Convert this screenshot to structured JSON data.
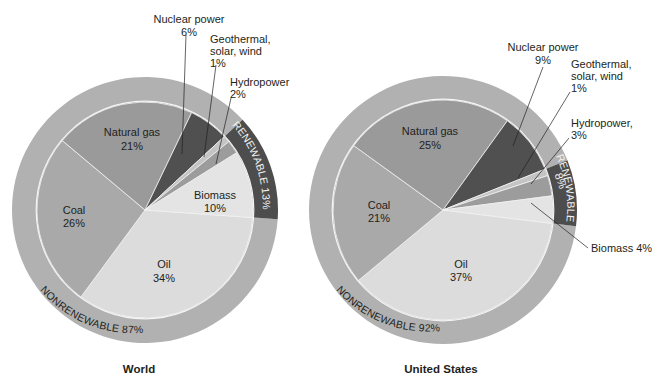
{
  "chart_data": [
    {
      "type": "pie",
      "title": "World",
      "categories": [
        "Oil",
        "Coal",
        "Natural gas",
        "Nuclear power",
        "Geothermal, solar, wind",
        "Hydropower",
        "Biomass"
      ],
      "values": [
        34,
        26,
        21,
        6,
        1,
        2,
        10
      ],
      "groups": [
        {
          "name": "NONRENEWABLE",
          "value": 87,
          "members": [
            "Oil",
            "Coal",
            "Natural gas",
            "Nuclear power"
          ]
        },
        {
          "name": "RENEWABLE",
          "value": 13,
          "members": [
            "Geothermal, solar, wind",
            "Hydropower",
            "Biomass"
          ]
        }
      ],
      "unit": "%"
    },
    {
      "type": "pie",
      "title": "United States",
      "categories": [
        "Oil",
        "Coal",
        "Natural gas",
        "Nuclear power",
        "Geothermal, solar, wind",
        "Hydropower",
        "Biomass"
      ],
      "values": [
        37,
        21,
        25,
        9,
        1,
        3,
        4
      ],
      "groups": [
        {
          "name": "NONRENEWABLE",
          "value": 92,
          "members": [
            "Oil",
            "Coal",
            "Natural gas",
            "Nuclear power"
          ]
        },
        {
          "name": "RENEWABLE",
          "value": 8,
          "members": [
            "Geothermal, solar, wind",
            "Hydropower",
            "Biomass"
          ]
        }
      ],
      "unit": "%"
    }
  ],
  "colors": {
    "oil": "#dcdcdc",
    "coal": "#a9a9a9",
    "natural_gas": "#9a9a9a",
    "nuclear": "#505050",
    "geothermal": "#c4c4c4",
    "hydro": "#9c9c9c",
    "biomass": "#e4e4e4",
    "nonrenewable_ring": "#b1b1b1",
    "renewable_ring": "#4d4d4d",
    "divider": "#f4f4f4"
  },
  "world": {
    "title": "World",
    "labels": {
      "natural_gas": [
        "Natural gas",
        "21%"
      ],
      "coal": [
        "Coal",
        "26%"
      ],
      "oil": [
        "Oil",
        "34%"
      ],
      "biomass": [
        "Biomass",
        "10%"
      ],
      "nuclear": [
        "Nuclear power",
        "6%"
      ],
      "geothermal": [
        "Geothermal,",
        "solar, wind",
        "1%"
      ],
      "hydro": [
        "Hydropower",
        "2%"
      ]
    },
    "ring_nonrenewable": "NONRENEWABLE 87%",
    "ring_renewable": "RENEWABLE 13%"
  },
  "us": {
    "title": "United States",
    "labels": {
      "natural_gas": [
        "Natural gas",
        "25%"
      ],
      "coal": [
        "Coal",
        "21%"
      ],
      "oil": [
        "Oil",
        "37%"
      ],
      "biomass": [
        "Biomass 4%"
      ],
      "nuclear": [
        "Nuclear power",
        "9%"
      ],
      "geothermal": [
        "Geothermal,",
        "solar, wind",
        "1%"
      ],
      "hydro": [
        "Hydropower,",
        "3%"
      ]
    },
    "ring_nonrenewable": "NONRENEWABLE 92%",
    "ring_renewable": "RENEWABLE",
    "ring_renewable_pct": "8%"
  }
}
